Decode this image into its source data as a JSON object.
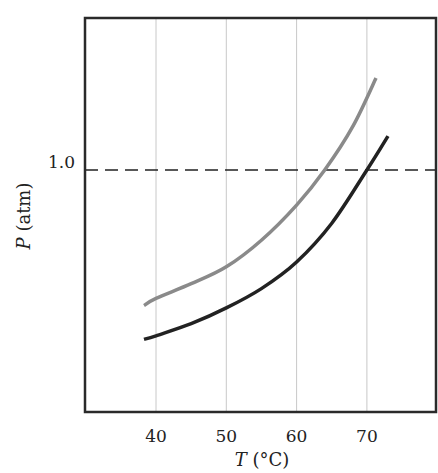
{
  "chart_data": {
    "type": "line",
    "title": "",
    "xlabel": "T (°C)",
    "xlabel_var": "T",
    "xlabel_unit": " (°C)",
    "ylabel": "P (atm)",
    "ylabel_var": "P",
    "ylabel_unit": " (atm)",
    "xlim": [
      30,
      80
    ],
    "ylim": [
      0,
      1.63
    ],
    "x_ticks": [
      40,
      50,
      60,
      70
    ],
    "x_tick_labels": [
      "40",
      "50",
      "60",
      "70"
    ],
    "y_ticks": [
      1.0
    ],
    "y_tick_labels": [
      "1.0"
    ],
    "grid": {
      "vertical": true,
      "horizontal": false
    },
    "reference_line": {
      "y": 1.0,
      "style": "dashed",
      "color": "#222222"
    },
    "legend": null,
    "series": [
      {
        "name": "upper curve (gray)",
        "color": "#8a8a8a",
        "x": [
          38.3,
          40,
          45,
          50,
          55,
          60,
          64,
          68,
          71.3
        ],
        "y": [
          0.44,
          0.47,
          0.53,
          0.6,
          0.71,
          0.855,
          1.0,
          1.18,
          1.38
        ]
      },
      {
        "name": "lower curve (black)",
        "color": "#222222",
        "x": [
          38.3,
          40,
          45,
          50,
          55,
          60,
          65,
          70,
          73.0
        ],
        "y": [
          0.3,
          0.315,
          0.365,
          0.43,
          0.51,
          0.62,
          0.78,
          1.0,
          1.14
        ]
      }
    ]
  },
  "labels": {
    "y_tick_1": "1.0",
    "x_ticks": [
      "40",
      "50",
      "60",
      "70"
    ],
    "x_axis_var": "T",
    "x_axis_unit": " (°C)",
    "y_axis_var": "P",
    "y_axis_unit": " (atm)"
  }
}
